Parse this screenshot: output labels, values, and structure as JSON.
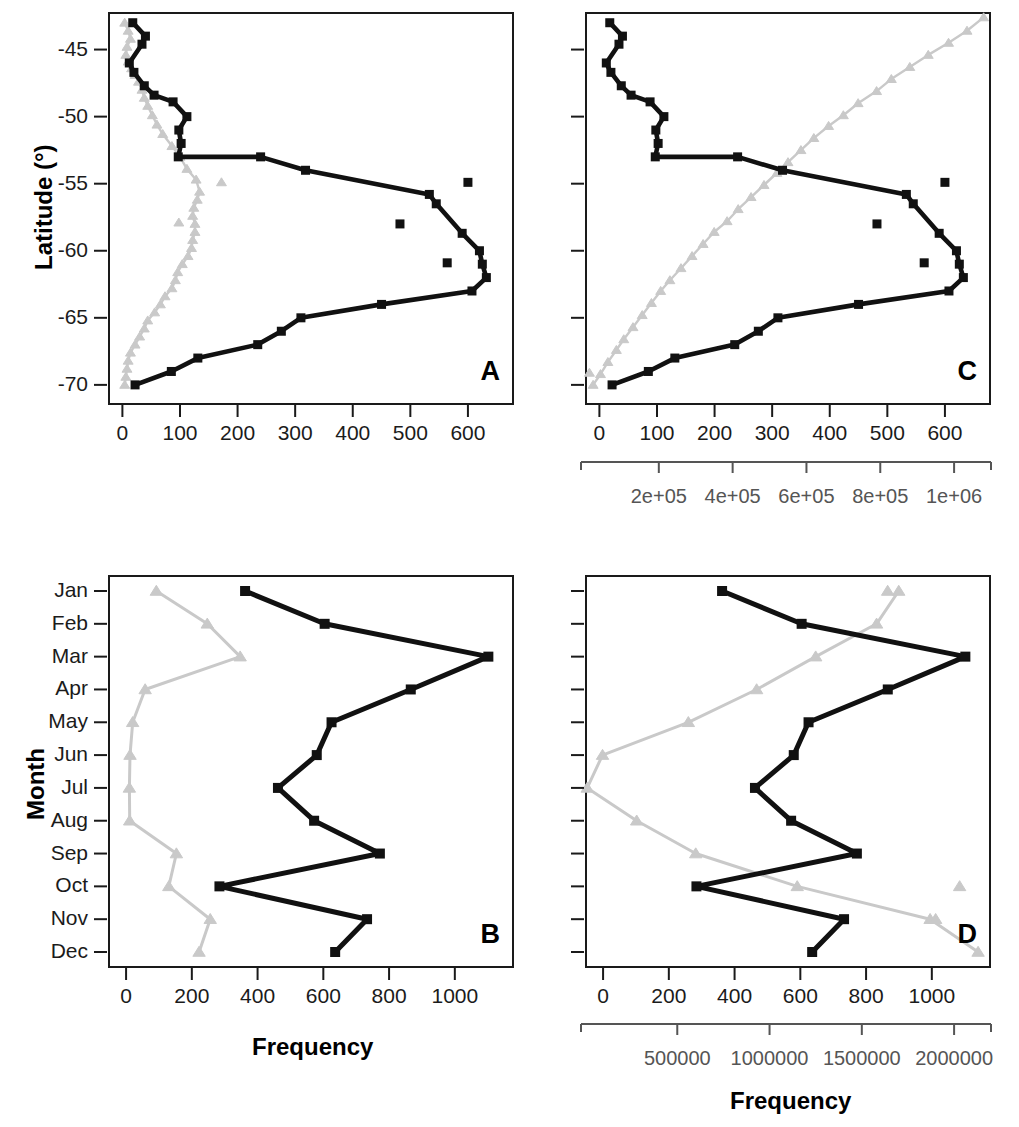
{
  "figure": {
    "panel_letters": {
      "a": "A",
      "b": "B",
      "c": "C",
      "d": "D"
    },
    "axis_titles": {
      "latitude": "Latitude (°)",
      "month": "Month",
      "frequency_b": "Frequency",
      "frequency_d": "Frequency"
    },
    "colors": {
      "black_series": "#111111",
      "gray_series": "#c9c9c9",
      "frame": "#1a1a1a",
      "gray_axis": "#555555"
    }
  },
  "chart_data": [
    {
      "id": "panel_a",
      "type": "line",
      "title": "A",
      "xlabel": "",
      "ylabel": "Latitude (°)",
      "xlim": [
        -25,
        680
      ],
      "ylim": [
        -71.5,
        -42.2
      ],
      "xticks": [
        0,
        100,
        200,
        300,
        400,
        500,
        600
      ],
      "xticklabels": [
        "0",
        "100",
        "200",
        "300",
        "400",
        "500",
        "600"
      ],
      "yticks": [
        -45,
        -50,
        -55,
        -60,
        -65,
        -70
      ],
      "yticklabels": [
        "-45",
        "-50",
        "-55",
        "-60",
        "-65",
        "-70"
      ],
      "grid": false,
      "legend": "none",
      "series": [
        {
          "name": "black-squares",
          "color": "#111111",
          "marker": "square",
          "points": [
            [
              18,
              -43.0
            ],
            [
              40,
              -44.0
            ],
            [
              34,
              -44.6
            ],
            [
              12,
              -46.0
            ],
            [
              20,
              -46.7
            ],
            [
              38,
              -47.7
            ],
            [
              55,
              -48.4
            ],
            [
              88,
              -48.9
            ],
            [
              112,
              -50.0
            ],
            [
              98,
              -51.0
            ],
            [
              102,
              -52.0
            ],
            [
              97,
              -53.0
            ],
            [
              240,
              -53.0
            ],
            [
              318,
              -54.0
            ],
            [
              533,
              -55.8
            ],
            [
              545,
              -56.5
            ],
            [
              590,
              -58.7
            ],
            [
              620,
              -60.0
            ],
            [
              625,
              -61.0
            ],
            [
              632,
              -62.0
            ],
            [
              607,
              -63.0
            ],
            [
              450,
              -64.0
            ],
            [
              310,
              -65.0
            ],
            [
              276,
              -66.0
            ],
            [
              235,
              -67.0
            ],
            [
              131,
              -68.0
            ],
            [
              85,
              -69.0
            ],
            [
              22,
              -70.0
            ]
          ]
        },
        {
          "name": "black-outliers",
          "color": "#111111",
          "marker": "square",
          "style": "points-only",
          "points": [
            [
              600,
              -54.9
            ],
            [
              482,
              -58.0
            ],
            [
              564,
              -60.9
            ]
          ]
        },
        {
          "name": "gray-triangles",
          "color": "#c9c9c9",
          "marker": "triangle",
          "points": [
            [
              4,
              -43.0
            ],
            [
              10,
              -43.6
            ],
            [
              14,
              -44.2
            ],
            [
              8,
              -44.8
            ],
            [
              6,
              -45.4
            ],
            [
              10,
              -45.9
            ],
            [
              16,
              -46.4
            ],
            [
              22,
              -46.9
            ],
            [
              28,
              -47.4
            ],
            [
              34,
              -48.0
            ],
            [
              38,
              -48.6
            ],
            [
              44,
              -49.2
            ],
            [
              52,
              -49.9
            ],
            [
              60,
              -50.6
            ],
            [
              70,
              -51.3
            ],
            [
              86,
              -52.2
            ],
            [
              100,
              -53.0
            ],
            [
              112,
              -53.9
            ],
            [
              128,
              -54.7
            ],
            [
              134,
              -55.6
            ],
            [
              130,
              -56.2
            ],
            [
              124,
              -56.8
            ],
            [
              122,
              -57.4
            ],
            [
              126,
              -58.0
            ],
            [
              126,
              -58.6
            ],
            [
              122,
              -59.2
            ],
            [
              120,
              -59.8
            ],
            [
              114,
              -60.4
            ],
            [
              104,
              -61.0
            ],
            [
              96,
              -61.6
            ],
            [
              92,
              -62.2
            ],
            [
              86,
              -62.8
            ],
            [
              74,
              -63.4
            ],
            [
              66,
              -64.0
            ],
            [
              56,
              -64.6
            ],
            [
              44,
              -65.2
            ],
            [
              38,
              -65.8
            ],
            [
              30,
              -66.4
            ],
            [
              22,
              -67.0
            ],
            [
              14,
              -67.6
            ],
            [
              10,
              -68.2
            ],
            [
              8,
              -68.8
            ],
            [
              6,
              -69.4
            ],
            [
              4,
              -70.0
            ]
          ]
        },
        {
          "name": "gray-outliers",
          "color": "#c9c9c9",
          "marker": "triangle",
          "style": "points-only",
          "points": [
            [
              172,
              -54.9
            ],
            [
              98,
              -57.9
            ]
          ]
        }
      ]
    },
    {
      "id": "panel_c",
      "type": "line",
      "title": "C",
      "xlabel": "",
      "ylabel": "Latitude (°)",
      "xlim": [
        -25,
        680
      ],
      "ylim": [
        -71.5,
        -42.2
      ],
      "xticks": [
        0,
        100,
        200,
        300,
        400,
        500,
        600
      ],
      "xticklabels": [
        "0",
        "100",
        "200",
        "300",
        "400",
        "500",
        "600"
      ],
      "secondary_xticks": [
        200000,
        400000,
        600000,
        800000,
        1000000
      ],
      "secondary_xticklabels": [
        "2e+05",
        "4e+05",
        "6e+05",
        "8e+05",
        "1e+06"
      ],
      "secondary_xlim": [
        0,
        1100000
      ],
      "yticks": [
        -45,
        -50,
        -55,
        -60,
        -65,
        -70
      ],
      "yticklabels": [
        "-45",
        "-50",
        "-55",
        "-60",
        "-65",
        "-70"
      ],
      "grid": false,
      "legend": "none",
      "series": [
        {
          "name": "black-squares",
          "color": "#111111",
          "marker": "square",
          "points": [
            [
              18,
              -43.0
            ],
            [
              40,
              -44.0
            ],
            [
              34,
              -44.6
            ],
            [
              12,
              -46.0
            ],
            [
              20,
              -46.7
            ],
            [
              38,
              -47.7
            ],
            [
              55,
              -48.4
            ],
            [
              88,
              -48.9
            ],
            [
              112,
              -50.0
            ],
            [
              98,
              -51.0
            ],
            [
              102,
              -52.0
            ],
            [
              97,
              -53.0
            ],
            [
              240,
              -53.0
            ],
            [
              318,
              -54.0
            ],
            [
              533,
              -55.8
            ],
            [
              545,
              -56.5
            ],
            [
              590,
              -58.7
            ],
            [
              620,
              -60.0
            ],
            [
              625,
              -61.0
            ],
            [
              632,
              -62.0
            ],
            [
              607,
              -63.0
            ],
            [
              450,
              -64.0
            ],
            [
              310,
              -65.0
            ],
            [
              276,
              -66.0
            ],
            [
              235,
              -67.0
            ],
            [
              131,
              -68.0
            ],
            [
              85,
              -69.0
            ],
            [
              22,
              -70.0
            ]
          ]
        },
        {
          "name": "black-outliers",
          "color": "#111111",
          "marker": "square",
          "style": "points-only",
          "points": [
            [
              600,
              -54.9
            ],
            [
              482,
              -58.0
            ],
            [
              564,
              -60.9
            ]
          ]
        },
        {
          "name": "gray-triangles-secondary",
          "color": "#c9c9c9",
          "marker": "triangle",
          "axis": "secondary",
          "points": [
            [
              1080000,
              -42.6
            ],
            [
              1035000,
              -43.6
            ],
            [
              985000,
              -44.5
            ],
            [
              930000,
              -45.4
            ],
            [
              880000,
              -46.3
            ],
            [
              830000,
              -47.2
            ],
            [
              790000,
              -48.1
            ],
            [
              740000,
              -49.0
            ],
            [
              700000,
              -49.9
            ],
            [
              660000,
              -50.7
            ],
            [
              620000,
              -51.6
            ],
            [
              585000,
              -52.5
            ],
            [
              550000,
              -53.4
            ],
            [
              520000,
              -54.2
            ],
            [
              485000,
              -55.1
            ],
            [
              450000,
              -56.0
            ],
            [
              415000,
              -56.9
            ],
            [
              385000,
              -57.8
            ],
            [
              350000,
              -58.6
            ],
            [
              320000,
              -59.5
            ],
            [
              290000,
              -60.4
            ],
            [
              260000,
              -61.3
            ],
            [
              230000,
              -62.2
            ],
            [
              205000,
              -63.0
            ],
            [
              180000,
              -63.9
            ],
            [
              155000,
              -64.8
            ],
            [
              130000,
              -65.7
            ],
            [
              105000,
              -66.6
            ],
            [
              85000,
              -67.4
            ],
            [
              62000,
              -68.3
            ],
            [
              42000,
              -69.2
            ],
            [
              22000,
              -70.0
            ]
          ]
        },
        {
          "name": "gray-outlier-secondary",
          "color": "#c9c9c9",
          "marker": "triangle",
          "axis": "secondary",
          "style": "points-only",
          "points": [
            [
              12000,
              -69.1
            ]
          ]
        }
      ]
    },
    {
      "id": "panel_b",
      "type": "line",
      "title": "B",
      "xlabel": "Frequency",
      "ylabel": "Month",
      "xlim": [
        -55,
        1180
      ],
      "categories": [
        "Jan",
        "Feb",
        "Mar",
        "Apr",
        "May",
        "Jun",
        "Jul",
        "Aug",
        "Sep",
        "Oct",
        "Nov",
        "Dec"
      ],
      "xticks": [
        0,
        200,
        400,
        600,
        800,
        1000
      ],
      "xticklabels": [
        "0",
        "200",
        "400",
        "600",
        "800",
        "1000"
      ],
      "grid": false,
      "legend": "none",
      "series": [
        {
          "name": "black-squares",
          "color": "#111111",
          "marker": "square",
          "values": [
            362,
            604,
            1102,
            866,
            625,
            580,
            462,
            572,
            772,
            284,
            733,
            636
          ]
        },
        {
          "name": "gray-triangles",
          "color": "#c9c9c9",
          "marker": "triangle",
          "values": [
            92,
            247,
            347,
            58,
            20,
            12,
            10,
            11,
            153,
            130,
            256,
            222
          ]
        }
      ]
    },
    {
      "id": "panel_d",
      "type": "line",
      "title": "D",
      "xlabel": "Frequency",
      "ylabel": "Month",
      "xlim": [
        -55,
        1180
      ],
      "categories": [
        "Jan",
        "Feb",
        "Mar",
        "Apr",
        "May",
        "Jun",
        "Jul",
        "Aug",
        "Sep",
        "Oct",
        "Nov",
        "Dec"
      ],
      "xticks": [
        0,
        200,
        400,
        600,
        800,
        1000
      ],
      "xticklabels": [
        "0",
        "200",
        "400",
        "600",
        "800",
        "1000"
      ],
      "secondary_xticks": [
        500000,
        1000000,
        1500000,
        2000000
      ],
      "secondary_xticklabels": [
        "500000",
        "1000000",
        "1500000",
        "2000000"
      ],
      "secondary_xlim": [
        0,
        2200000
      ],
      "grid": false,
      "legend": "none",
      "series": [
        {
          "name": "black-squares",
          "color": "#111111",
          "marker": "square",
          "values": [
            362,
            604,
            1102,
            866,
            625,
            580,
            462,
            572,
            772,
            284,
            733,
            636
          ]
        },
        {
          "name": "gray-triangles-secondary",
          "color": "#c9c9c9",
          "marker": "triangle",
          "axis": "secondary",
          "values": [
            1700000,
            1580000,
            1250000,
            930000,
            560000,
            95000,
            12000,
            280000,
            600000,
            1150000,
            1870000,
            2130000
          ]
        },
        {
          "name": "gray-outliers-secondary",
          "color": "#c9c9c9",
          "marker": "triangle",
          "axis": "secondary",
          "style": "points-only",
          "values_points": [
            [
              2030000,
              "Oct"
            ],
            [
              1900000,
              "Nov"
            ],
            [
              1640000,
              "Jan"
            ]
          ]
        }
      ]
    }
  ]
}
